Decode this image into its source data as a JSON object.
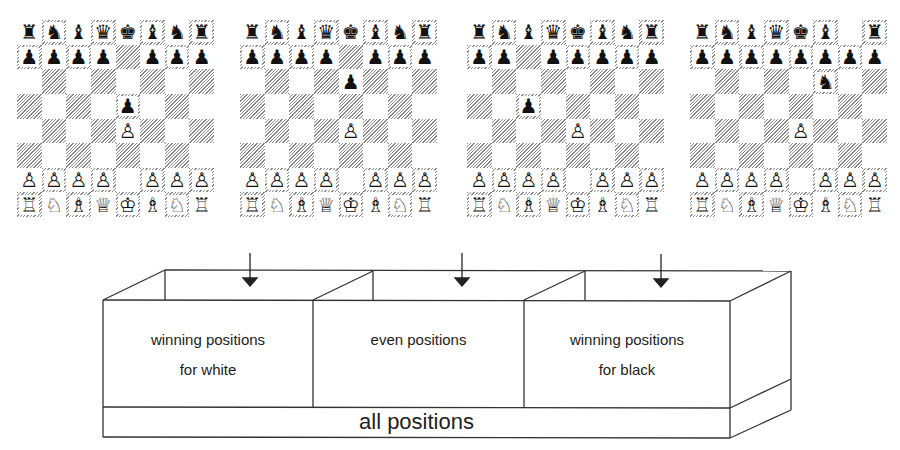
{
  "boards": [
    {
      "name": "board-e4-e5",
      "rows": [
        [
          "♜",
          "♞",
          "♝",
          "♛",
          "♚",
          "♝",
          "♞",
          "♜"
        ],
        [
          "♟",
          "♟",
          "♟",
          "♟",
          "",
          "♟",
          "♟",
          "♟"
        ],
        [
          "",
          "",
          "",
          "",
          "",
          "",
          "",
          ""
        ],
        [
          "",
          "",
          "",
          "",
          "♟",
          "",
          "",
          ""
        ],
        [
          "",
          "",
          "",
          "",
          "♙",
          "",
          "",
          ""
        ],
        [
          "",
          "",
          "",
          "",
          "",
          "",
          "",
          ""
        ],
        [
          "♙",
          "♙",
          "♙",
          "♙",
          "",
          "♙",
          "♙",
          "♙"
        ],
        [
          "♖",
          "♘",
          "♗",
          "♕",
          "♔",
          "♗",
          "♘",
          "♖"
        ]
      ]
    },
    {
      "name": "board-e4-e6",
      "rows": [
        [
          "♜",
          "♞",
          "♝",
          "♛",
          "♚",
          "♝",
          "♞",
          "♜"
        ],
        [
          "♟",
          "♟",
          "♟",
          "♟",
          "",
          "♟",
          "♟",
          "♟"
        ],
        [
          "",
          "",
          "",
          "",
          "♟",
          "",
          "",
          ""
        ],
        [
          "",
          "",
          "",
          "",
          "",
          "",
          "",
          ""
        ],
        [
          "",
          "",
          "",
          "",
          "♙",
          "",
          "",
          ""
        ],
        [
          "",
          "",
          "",
          "",
          "",
          "",
          "",
          ""
        ],
        [
          "♙",
          "♙",
          "♙",
          "♙",
          "",
          "♙",
          "♙",
          "♙"
        ],
        [
          "♖",
          "♘",
          "♗",
          "♕",
          "♔",
          "♗",
          "♘",
          "♖"
        ]
      ]
    },
    {
      "name": "board-e4-c5",
      "rows": [
        [
          "♜",
          "♞",
          "♝",
          "♛",
          "♚",
          "♝",
          "♞",
          "♜"
        ],
        [
          "♟",
          "♟",
          "",
          "♟",
          "♟",
          "♟",
          "♟",
          "♟"
        ],
        [
          "",
          "",
          "",
          "",
          "",
          "",
          "",
          ""
        ],
        [
          "",
          "",
          "♟",
          "",
          "",
          "",
          "",
          ""
        ],
        [
          "",
          "",
          "",
          "",
          "♙",
          "",
          "",
          ""
        ],
        [
          "",
          "",
          "",
          "",
          "",
          "",
          "",
          ""
        ],
        [
          "♙",
          "♙",
          "♙",
          "♙",
          "",
          "♙",
          "♙",
          "♙"
        ],
        [
          "♖",
          "♘",
          "♗",
          "♕",
          "♔",
          "♗",
          "♘",
          "♖"
        ]
      ]
    },
    {
      "name": "board-e4-nf6",
      "rows": [
        [
          "♜",
          "♞",
          "♝",
          "♛",
          "♚",
          "♝",
          "",
          "♜"
        ],
        [
          "♟",
          "♟",
          "♟",
          "♟",
          "♟",
          "♟",
          "♟",
          "♟"
        ],
        [
          "",
          "",
          "",
          "",
          "",
          "♞",
          "",
          ""
        ],
        [
          "",
          "",
          "",
          "",
          "",
          "",
          "",
          ""
        ],
        [
          "",
          "",
          "",
          "",
          "♙",
          "",
          "",
          ""
        ],
        [
          "",
          "",
          "",
          "",
          "",
          "",
          "",
          ""
        ],
        [
          "♙",
          "♙",
          "♙",
          "♙",
          "",
          "♙",
          "♙",
          "♙"
        ],
        [
          "♖",
          "♘",
          "♗",
          "♕",
          "♔",
          "♗",
          "♘",
          "♖"
        ]
      ]
    }
  ],
  "diagram": {
    "compartments": [
      {
        "line1": "winning positions",
        "line2": "for white"
      },
      {
        "line1": "even positions",
        "line2": ""
      },
      {
        "line1": "winning positions",
        "line2": "for black"
      }
    ],
    "base_label": "all positions",
    "stroke_color": "#333333"
  }
}
